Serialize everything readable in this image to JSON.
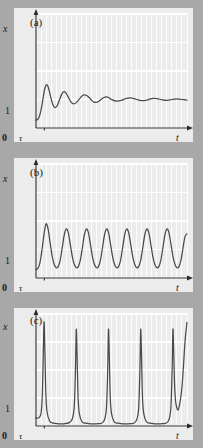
{
  "figure": {
    "title": "",
    "panel_count": 3,
    "background_color": "#a8a8a8",
    "plot_background_color": "#ececec",
    "grid_color": "#ffffff",
    "curve_color": "#4a4a4a",
    "axis_color": "#2a2a2a",
    "text_color": "#1a1a1a"
  },
  "labels": {
    "y_axis": "x",
    "x_axis": "t",
    "origin": "0",
    "tau": "τ",
    "one": "1",
    "panel_a": "(a)",
    "panel_b": "(b)",
    "panel_c": "(c)"
  },
  "chart_data": [
    {
      "type": "line",
      "panel": "(a)",
      "title": "",
      "xlabel": "t",
      "ylabel": "x",
      "xlim": [
        0,
        30
      ],
      "ylim": [
        0,
        4
      ],
      "grid": true,
      "grid_x_step": 1,
      "grid_y_step": 1,
      "tick_labels_x": [
        "0",
        "τ"
      ],
      "tick_labels_y": [
        "1"
      ],
      "description": "Damped oscillation converging to steady state x = 1",
      "series": [
        {
          "name": "damped oscillation",
          "x": [
            0.0,
            0.3,
            0.6,
            0.9,
            1.2,
            1.5,
            1.8,
            2.1,
            2.4,
            2.7,
            3.0,
            3.3,
            3.6,
            3.9,
            4.2,
            4.5,
            4.8,
            5.1,
            5.4,
            5.7,
            6.0,
            6.5,
            7.0,
            7.5,
            8.0,
            8.5,
            9.0,
            9.5,
            10.0,
            10.5,
            11.0,
            11.5,
            12.0,
            12.5,
            13.0,
            13.5,
            14.0,
            14.5,
            15.0,
            16.0,
            17.0,
            18.0,
            19.0,
            20.0,
            21.0,
            22.0,
            23.0,
            24.0,
            25.0,
            26.0,
            27.0,
            28.0,
            29.0,
            30.0
          ],
          "y": [
            0.28,
            0.3,
            0.38,
            0.55,
            0.82,
            1.15,
            1.42,
            1.52,
            1.45,
            1.26,
            1.03,
            0.84,
            0.74,
            0.72,
            0.78,
            0.9,
            1.05,
            1.18,
            1.26,
            1.27,
            1.22,
            1.05,
            0.9,
            0.85,
            0.89,
            0.99,
            1.1,
            1.16,
            1.15,
            1.08,
            0.98,
            0.91,
            0.9,
            0.94,
            1.01,
            1.07,
            1.09,
            1.06,
            1.0,
            0.94,
            0.97,
            1.04,
            1.05,
            1.0,
            0.96,
            0.98,
            1.03,
            1.03,
            0.99,
            0.97,
            1.0,
            1.02,
            1.0,
            0.98
          ]
        }
      ]
    },
    {
      "type": "line",
      "panel": "(b)",
      "title": "",
      "xlabel": "t",
      "ylabel": "x",
      "xlim": [
        0,
        30
      ],
      "ylim": [
        0,
        4
      ],
      "grid": true,
      "grid_x_step": 1,
      "grid_y_step": 1,
      "tick_labels_x": [
        "0",
        "τ"
      ],
      "tick_labels_y": [
        "1"
      ],
      "description": "Sustained limit-cycle oscillation of roughly constant amplitude about x = 1",
      "series": [
        {
          "name": "sustained oscillation",
          "x": [
            0.0,
            0.4,
            0.8,
            1.2,
            1.6,
            2.0,
            2.4,
            2.8,
            3.2,
            3.6,
            4.0,
            4.4,
            4.8,
            5.2,
            5.6,
            6.0,
            6.4,
            6.8,
            7.2,
            7.6,
            8.0,
            8.4,
            8.8,
            9.2,
            9.6,
            10.0,
            10.4,
            10.8,
            11.2,
            11.6,
            12.0,
            12.4,
            12.8,
            13.2,
            13.6,
            14.0,
            14.4,
            14.8,
            15.2,
            15.6,
            16.0,
            16.4,
            16.8,
            17.2,
            17.6,
            18.0,
            18.4,
            18.8,
            19.2,
            19.6,
            20.0,
            20.4,
            20.8,
            21.2,
            21.6,
            22.0,
            22.4,
            22.8,
            23.2,
            23.6,
            24.0,
            24.4,
            24.8,
            25.2,
            25.6,
            26.0,
            26.4,
            26.8,
            27.2,
            27.6,
            28.0,
            28.4,
            28.8,
            29.2,
            29.6,
            30.0
          ],
          "y": [
            0.3,
            0.34,
            0.55,
            1.0,
            1.55,
            1.9,
            1.72,
            1.25,
            0.78,
            0.48,
            0.36,
            0.4,
            0.62,
            1.05,
            1.5,
            1.72,
            1.6,
            1.2,
            0.76,
            0.48,
            0.36,
            0.4,
            0.62,
            1.05,
            1.5,
            1.72,
            1.6,
            1.2,
            0.76,
            0.48,
            0.36,
            0.4,
            0.62,
            1.05,
            1.5,
            1.72,
            1.6,
            1.2,
            0.76,
            0.48,
            0.36,
            0.4,
            0.62,
            1.05,
            1.5,
            1.72,
            1.6,
            1.2,
            0.76,
            0.48,
            0.36,
            0.4,
            0.62,
            1.05,
            1.5,
            1.72,
            1.6,
            1.2,
            0.76,
            0.48,
            0.36,
            0.4,
            0.62,
            1.05,
            1.5,
            1.72,
            1.6,
            1.2,
            0.76,
            0.48,
            0.36,
            0.4,
            0.62,
            1.05,
            1.45,
            1.55
          ]
        }
      ]
    },
    {
      "type": "line",
      "panel": "(c)",
      "title": "",
      "xlabel": "t",
      "ylabel": "x",
      "xlim": [
        0,
        30
      ],
      "ylim": [
        0,
        4
      ],
      "grid": true,
      "grid_x_step": 1,
      "grid_y_step": 1,
      "tick_labels_x": [
        "0",
        "τ"
      ],
      "tick_labels_y": [
        "1"
      ],
      "description": "Large-amplitude relaxation oscillation: narrow spikes reaching x ≈ 3.7 separated by long quiescent intervals near x ≈ 0.1",
      "series": [
        {
          "name": "relaxation oscillation spikes",
          "peak_value": 3.7,
          "baseline_value": 0.1,
          "period": 6.4,
          "spike_times": [
            1.6,
            8.0,
            14.4,
            20.8,
            27.2
          ],
          "x": [
            0.0,
            0.6,
            1.0,
            1.25,
            1.45,
            1.6,
            1.75,
            1.95,
            2.2,
            2.7,
            3.4,
            4.4,
            5.6,
            6.6,
            7.2,
            7.6,
            7.85,
            8.0,
            8.15,
            8.35,
            8.6,
            9.1,
            9.8,
            10.8,
            12.0,
            13.0,
            13.6,
            14.0,
            14.25,
            14.4,
            14.55,
            14.75,
            15.0,
            15.5,
            16.2,
            17.2,
            18.4,
            19.4,
            20.0,
            20.4,
            20.65,
            20.8,
            20.95,
            21.15,
            21.4,
            21.9,
            22.6,
            23.6,
            24.8,
            25.8,
            26.4,
            26.8,
            27.05,
            27.2,
            27.35,
            27.55,
            27.8,
            28.3,
            29.0,
            29.6,
            30.0
          ],
          "y": [
            0.28,
            0.3,
            0.45,
            1.1,
            2.6,
            3.72,
            2.8,
            1.2,
            0.5,
            0.18,
            0.1,
            0.08,
            0.08,
            0.12,
            0.25,
            0.7,
            2.1,
            3.45,
            2.6,
            1.05,
            0.45,
            0.16,
            0.1,
            0.08,
            0.08,
            0.1,
            0.22,
            0.65,
            2.05,
            3.45,
            2.6,
            1.05,
            0.45,
            0.16,
            0.1,
            0.08,
            0.08,
            0.1,
            0.22,
            0.65,
            2.05,
            3.45,
            2.6,
            1.05,
            0.45,
            0.16,
            0.1,
            0.08,
            0.08,
            0.1,
            0.22,
            0.65,
            2.05,
            3.45,
            2.7,
            1.4,
            0.8,
            0.6,
            1.4,
            3.0,
            3.7
          ]
        }
      ]
    }
  ]
}
